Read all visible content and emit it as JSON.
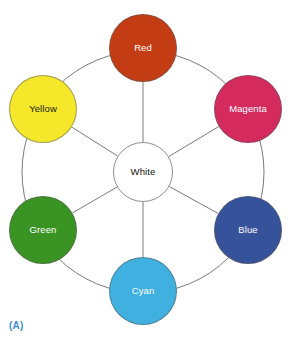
{
  "figure": {
    "name": "additive-color-wheel",
    "caption": "(A)",
    "caption_color": "#3E8FD0",
    "background": "#ffffff",
    "geometry": {
      "center_x": 143,
      "center_y": 172,
      "ring_radius": 121,
      "node_diameter": 68,
      "center_node_diameter": 60,
      "ring_stroke": "#7a7a7a"
    },
    "center_node": {
      "label": "White",
      "fill": "#ffffff",
      "text_color": "#111111",
      "stroke": "#8d8d8d"
    },
    "nodes": [
      {
        "label": "Red",
        "fill": "#C43C14",
        "text_color": "#ffffff",
        "angle_deg": 270,
        "x": 109,
        "y": 14
      },
      {
        "label": "Magenta",
        "fill": "#D42A5E",
        "text_color": "#ffffff",
        "angle_deg": 330,
        "x": 214,
        "y": 75
      },
      {
        "label": "Blue",
        "fill": "#36529B",
        "text_color": "#ffffff",
        "angle_deg": 30,
        "x": 214,
        "y": 196
      },
      {
        "label": "Cyan",
        "fill": "#3FB0E0",
        "text_color": "#ffffff",
        "angle_deg": 90,
        "x": 109,
        "y": 257
      },
      {
        "label": "Green",
        "fill": "#3A9424",
        "text_color": "#ffffff",
        "angle_deg": 150,
        "x": 9,
        "y": 196
      },
      {
        "label": "Yellow",
        "fill": "#F5E82A",
        "text_color": "#1a1a1a",
        "angle_deg": 210,
        "x": 9,
        "y": 75
      }
    ]
  }
}
